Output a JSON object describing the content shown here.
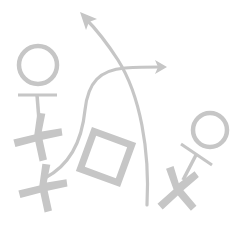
{
  "diagram": {
    "title": "",
    "kind": "play-diagram",
    "colors": {
      "background": "#ffffff",
      "stroke": "#c6c6c6"
    },
    "elements": [
      {
        "type": "o-player",
        "label": "circle-player-left"
      },
      {
        "type": "o-player",
        "label": "circle-player-right"
      },
      {
        "type": "x-player",
        "label": "x-player-left-upper"
      },
      {
        "type": "x-player",
        "label": "x-player-left-lower"
      },
      {
        "type": "x-player",
        "label": "x-player-right"
      },
      {
        "type": "square",
        "label": "square-marker"
      },
      {
        "type": "arrow",
        "label": "route-arrow-up-left"
      },
      {
        "type": "arrow",
        "label": "route-arrow-right"
      }
    ]
  }
}
